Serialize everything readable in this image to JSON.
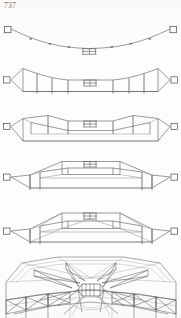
{
  "page": {
    "number_label": "737",
    "width": 181,
    "height": 318,
    "background_color": "#fdfdfd",
    "ink_color": "#58585c"
  },
  "figures": [
    {
      "id": "fig-1",
      "name": "suspended-cable-sagging-span",
      "caption": "",
      "top": 24,
      "height": 34,
      "description": "Shallow sagging catenary chord between two pinned end supports with small central hanger frame"
    },
    {
      "id": "fig-2",
      "name": "shallow-truss-with-vertical-posts",
      "caption": "",
      "top": 58,
      "height": 46,
      "description": "Lens truss with straight bottom chord, cambered top chord and six vertical posts, triangular end wedges to pinned supports"
    },
    {
      "id": "fig-3",
      "name": "deepened-truss-with-diagonals",
      "caption": "",
      "top": 104,
      "height": 46,
      "description": "Deeper truss with inclined end diagonals, inner vertical posts and sloping intermediate top chord segments"
    },
    {
      "id": "fig-4",
      "name": "trapezoidal-truss-raised-center",
      "caption": "",
      "top": 150,
      "height": 46,
      "description": "Trapezoidal truss with raised flat centre panel, long inclined chords down to the pinned end supports"
    },
    {
      "id": "fig-5",
      "name": "trapezoidal-truss-with-full-web",
      "caption": "",
      "top": 196,
      "height": 58,
      "description": "Trapezoidal truss as above with complete diagonal web bracing through every panel"
    },
    {
      "id": "fig-6",
      "name": "three-dimensional-roof-structure",
      "caption": "",
      "top": 254,
      "height": 64,
      "description": "Perspective view of the complete octagonal roof framing with radial trusses converging on a central hub"
    }
  ],
  "elements": {
    "support_label": "pin-support",
    "hanger_label": "central-hanger-frame",
    "node_label": "panel-point"
  }
}
